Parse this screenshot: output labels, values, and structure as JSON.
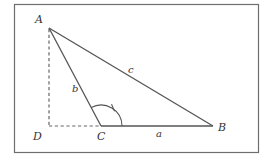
{
  "diagram": {
    "colors": {
      "frame": "#6e6e6e",
      "lines": "#555555",
      "text": "#333333",
      "background": "#ffffff"
    },
    "vertices": {
      "A": {
        "label": "A",
        "x": 49,
        "y": 28
      },
      "B": {
        "label": "B",
        "x": 213,
        "y": 126
      },
      "C": {
        "label": "C",
        "x": 101,
        "y": 126
      },
      "D": {
        "label": "D",
        "x": 49,
        "y": 126
      }
    },
    "sides": {
      "a": {
        "label": "a",
        "from": "C",
        "to": "B"
      },
      "b": {
        "label": "b",
        "from": "A",
        "to": "C"
      },
      "c": {
        "label": "c",
        "from": "A",
        "to": "B"
      }
    },
    "dashed_segments": [
      {
        "from": "A",
        "to": "D",
        "meaning": "altitude"
      },
      {
        "from": "D",
        "to": "C",
        "meaning": "extension of base"
      }
    ],
    "angle_mark": {
      "vertex": "C",
      "between": [
        "CA",
        "CB"
      ],
      "style": "arc with single tick"
    }
  }
}
